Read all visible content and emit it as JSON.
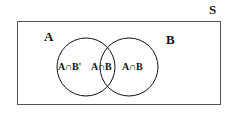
{
  "figure": {
    "type": "venn-diagram",
    "universe": {
      "label": "S",
      "shape": "rectangle",
      "stroke_color": "#555555"
    },
    "sets": [
      {
        "name": "A",
        "label": "A"
      },
      {
        "name": "B",
        "label": "B"
      }
    ],
    "regions": [
      {
        "name": "a-only",
        "label": "A∩B'"
      },
      {
        "name": "intersection",
        "label": "A∩B"
      },
      {
        "name": "b-only",
        "label": "A∩B"
      }
    ],
    "circle_stroke_color": "#111111",
    "background_color": "#ffffff"
  }
}
